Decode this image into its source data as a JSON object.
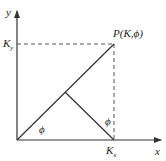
{
  "diagram": {
    "axes": {
      "x_label": "x",
      "y_label": "y"
    },
    "points": {
      "P_label": "P(K,ϕ)",
      "Kx_label_main": "K",
      "Kx_label_sub": "x",
      "Ky_label_main": "K",
      "Ky_label_sub": "y"
    },
    "angles": {
      "phi_origin": "ϕ",
      "phi_vertical": "ϕ"
    },
    "colors": {
      "line": "#333333",
      "dashed": "#555555",
      "background": "#ffffff"
    }
  }
}
